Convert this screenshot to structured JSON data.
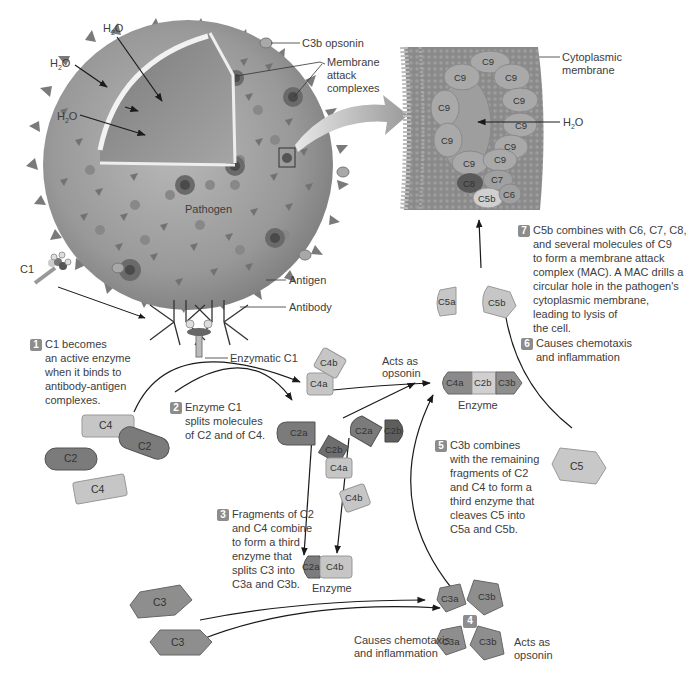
{
  "colors": {
    "pathogen_fill": "#9a9a9a",
    "pathogen_dark": "#6e6e6e",
    "membrane_fill": "#8a8a8a",
    "c9_fill": "#a8a8a8",
    "c4_fill": "#c6c6c6",
    "c2_fill": "#7b7b7b",
    "c3_fill": "#8e8e8e",
    "c2b_fill": "#b8b8b8",
    "badge": "#8c8c8c",
    "text": "#3d3d3d",
    "arrow": "#1a1a1a"
  },
  "pathogen": {
    "label": "Pathogen",
    "water_labels": [
      "H2O",
      "H2O",
      "H2O"
    ],
    "callouts": {
      "c3b_opsonin": "C3b opsonin",
      "mac_line1": "Membrane",
      "mac_line2": "attack",
      "mac_line3": "complexes",
      "antigen": "Antigen",
      "antibody": "Antibody",
      "enzymatic_c1": "Enzymatic C1",
      "c1": "C1"
    }
  },
  "membrane_inset": {
    "callout_line1": "Cytoplasmic",
    "callout_line2": "membrane",
    "water_label": "H2O",
    "c9_units": [
      "C9",
      "C9",
      "C9",
      "C9",
      "C9",
      "C9",
      "C9",
      "C9",
      "C9",
      "C9"
    ],
    "c8": "C8",
    "c7": "C7",
    "c6": "C6",
    "c5b": "C5b"
  },
  "steps": [
    {
      "number": "1",
      "lines": [
        "C1 becomes",
        "an active enzyme",
        "when it binds to",
        "antibody-antigen",
        "complexes."
      ]
    },
    {
      "number": "2",
      "lines": [
        "Enzyme C1",
        "splits molecules",
        "of C2 and of C4."
      ]
    },
    {
      "number": "3",
      "lines": [
        "Fragments of C2",
        "and C4 combine",
        "to form a third",
        "enzyme that",
        "splits C3 into",
        "C3a and C3b."
      ]
    },
    {
      "number": "4",
      "lines": []
    },
    {
      "number": "5",
      "lines": [
        "C3b combines",
        "with the remaining",
        "fragments of C2",
        "and C4 to form a",
        "third enzyme that",
        "cleaves C5 into",
        "C5a and C5b."
      ]
    },
    {
      "number": "6",
      "lines": [
        "Causes chemotaxis",
        "and inflammation"
      ]
    },
    {
      "number": "7",
      "lines": [
        "C5b combines with C6, C7, C8,",
        "and several molecules of C9",
        "to form a membrane attack",
        "complex (MAC). A MAC drills a",
        "circular hole in the pathogen's",
        "cytoplasmic membrane,",
        "leading to lysis of",
        "the cell."
      ]
    }
  ],
  "molecules": {
    "c4_top": "C4",
    "c2_left": "C2",
    "c2_right": "C2",
    "c4_bottom": "C4",
    "c4a_top": "C4a",
    "c4b_top": "C4b",
    "c2a_left": "C2a",
    "c2b_mid": "C2b",
    "c4a_mid": "C4a",
    "c4b_mid": "C4b",
    "c2a_right": "C2a",
    "c2b_right": "C2b",
    "enzyme_c5_convertase": [
      "C4a",
      "C2b",
      "C3b"
    ],
    "enzyme_c3_convertase": [
      "C2a",
      "C4b"
    ],
    "enzyme_label": "Enzyme",
    "c3_top": "C3",
    "c3_bottom": "C3",
    "c3a_top": "C3a",
    "c3b_top": "C3b",
    "c3a_bottom": "C3a",
    "c3b_bottom": "C3b",
    "c5": "C5",
    "c5a": "C5a",
    "c5b": "C5b"
  },
  "annotations": {
    "c4b_acts_as_line1": "Acts as",
    "c4b_acts_as_line2": "opsonin",
    "c3b_acts_as_line1": "Acts as",
    "c3b_acts_as_line2": "opsonin",
    "c3a_effect_line1": "Causes chemotaxis",
    "c3a_effect_line2": "and inflammation"
  }
}
